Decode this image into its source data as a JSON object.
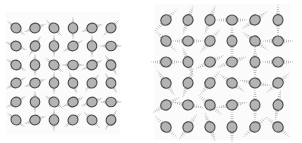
{
  "figure": {
    "width": 302,
    "height": 143,
    "background": "#ffffff",
    "colors": {
      "circle_fill": "#b4b4b4",
      "circle_stroke": "#4a4a4a",
      "wing_stroke": "#9a9a9a",
      "panel_bg": "#fbfbfb"
    }
  },
  "panels": [
    {
      "name": "left-panel",
      "bg": {
        "x": 6,
        "y": 12,
        "w": 114,
        "h": 122
      },
      "cols_x": [
        16,
        35,
        54,
        73,
        92,
        111
      ],
      "rows_y": [
        28,
        46,
        65,
        83,
        102,
        120
      ],
      "circle_r": 5.2,
      "wing_length": 8.5,
      "wing_width": 4.5,
      "angles": [
        [
          -40,
          20,
          -45,
          90,
          20,
          45
        ],
        [
          -20,
          60,
          90,
          30,
          90,
          0
        ],
        [
          -30,
          90,
          -40,
          0,
          25,
          -60
        ],
        [
          30,
          20,
          90,
          -70,
          50,
          -60
        ],
        [
          30,
          90,
          -35,
          25,
          20,
          0
        ],
        [
          -40,
          20,
          90,
          40,
          -45,
          60
        ]
      ]
    },
    {
      "name": "right-panel",
      "bg": {
        "x": 154,
        "y": 4,
        "w": 136,
        "h": 136
      },
      "cols_x": [
        166,
        188,
        210,
        232,
        255,
        278
      ],
      "rows_y": [
        20,
        41,
        62,
        83,
        105,
        127
      ],
      "circle_r": 5.4,
      "wing_length": 12.5,
      "wing_width": 5.5,
      "angles": [
        [
          45,
          70,
          -110,
          0,
          35,
          90
        ],
        [
          -45,
          0,
          50,
          90,
          -35,
          0
        ],
        [
          0,
          -70,
          25,
          20,
          90,
          0
        ],
        [
          -55,
          70,
          50,
          -35,
          -10,
          40
        ],
        [
          30,
          -10,
          -40,
          10,
          90,
          80
        ],
        [
          -45,
          55,
          -70,
          90,
          40,
          -40
        ]
      ]
    }
  ]
}
